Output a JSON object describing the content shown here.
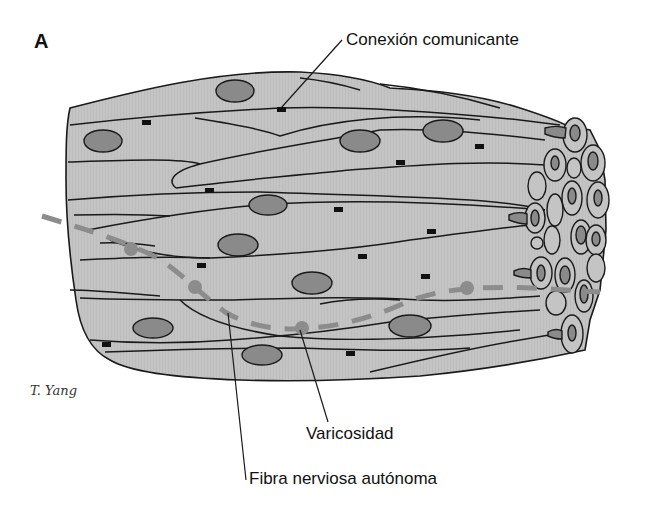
{
  "figure": {
    "panel_letter": "A",
    "signature": "T. Yang"
  },
  "labels": {
    "gap_junction": "Conexión comunicante",
    "varicosity": "Varicosidad",
    "autonomic_nerve_fiber": "Fibra nerviosa autónoma"
  },
  "colors": {
    "cell_fill": "#c4c4c4",
    "nucleus_fill": "#8a8a8a",
    "outline": "#1a1a1a",
    "nerve_fiber": "#8c8c8c",
    "gap_junction": "#111111",
    "background": "#ffffff"
  }
}
